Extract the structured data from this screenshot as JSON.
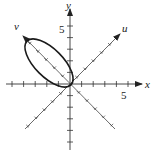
{
  "figure": {
    "type": "rotated-axes-ellipse",
    "axes": {
      "x_label": "x",
      "y_label": "y",
      "u_label": "u",
      "v_label": "v",
      "x_tick_label": "5",
      "y_tick_label": "5",
      "u_angle_deg": 45,
      "v_angle_deg": 135
    },
    "ellipse": {
      "center_uv": [
        0,
        2.5
      ],
      "semi_axis_v": 2.6,
      "semi_axis_u": 1.2,
      "orientation": "major axis along v-axis"
    },
    "colors": {
      "axis": "#333333",
      "curve": "#1a1a1a",
      "background": "#ffffff"
    }
  }
}
